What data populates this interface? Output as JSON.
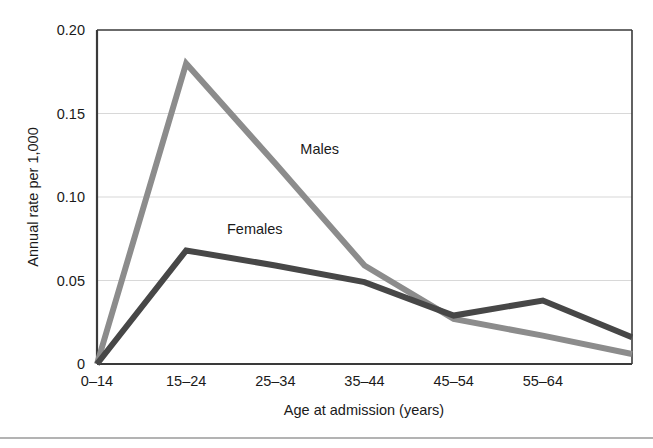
{
  "chart_data": {
    "type": "line",
    "title": "",
    "subtitle": "",
    "xlabel": "Age at admission (years)",
    "ylabel": "Annual rate per 1,000",
    "categories": [
      "0–14",
      "15–24",
      "25–34",
      "35–44",
      "45–54",
      "55–64",
      ""
    ],
    "x_tick_labels": [
      "0–14",
      "15–24",
      "25–34",
      "35–44",
      "45–54",
      "55–64"
    ],
    "y_tick_labels": [
      "0.20",
      "0.15",
      "0.10",
      "0.05",
      "0"
    ],
    "y_tick_values": [
      0.2,
      0.15,
      0.1,
      0.05,
      0
    ],
    "ylim": [
      0,
      0.2
    ],
    "grid": "horizontal",
    "legend_position": "inline-annotations",
    "series": [
      {
        "name": "Males",
        "color": "#8c8c8c",
        "values": [
          0.0,
          0.18,
          0.12,
          0.059,
          0.027,
          0.017,
          0.006
        ]
      },
      {
        "name": "Females",
        "color": "#474747",
        "values": [
          0.0,
          0.068,
          0.059,
          0.049,
          0.029,
          0.038,
          0.016
        ]
      }
    ],
    "annotations": [
      {
        "text": "Males",
        "x_frac": 0.38,
        "y_value": 0.126
      },
      {
        "text": "Females",
        "x_frac": 0.243,
        "y_value": 0.078
      }
    ],
    "axis_color": "#3a3a3a",
    "grid_color": "#d8d8d8",
    "background": "#ffffff",
    "line_width": 6
  },
  "footer": {
    "rule_color": "#9a9a9a"
  }
}
